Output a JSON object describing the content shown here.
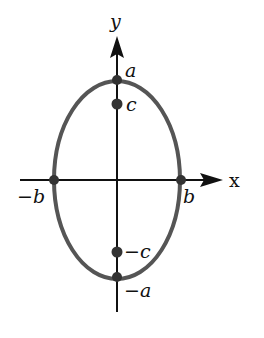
{
  "diagram": {
    "axes": {
      "x_label": "x",
      "y_label": "y"
    },
    "points": [
      {
        "id": "top-vertex",
        "label": "a"
      },
      {
        "id": "top-focus",
        "label": "c"
      },
      {
        "id": "right-covertex",
        "label": "b"
      },
      {
        "id": "left-covertex",
        "label": "−b"
      },
      {
        "id": "bottom-focus",
        "label": "−c"
      },
      {
        "id": "bottom-vertex",
        "label": "−a"
      }
    ],
    "colors": {
      "ellipse": "#555555",
      "axes": "#111111",
      "points": "#333333"
    }
  }
}
